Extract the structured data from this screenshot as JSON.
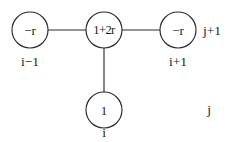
{
  "figure": {
    "kind": "finite-difference-stencil",
    "stroke_color": "#2b2b2b",
    "text_color": "#1c1c1c",
    "background_color": "#ffffff"
  },
  "nodes": [
    {
      "id": "left",
      "value": "−r",
      "cx": 30,
      "cy": 30,
      "r": 18
    },
    {
      "id": "center",
      "value": "1+2r",
      "cx": 104,
      "cy": 30,
      "r": 18
    },
    {
      "id": "right",
      "value": "−r",
      "cx": 178,
      "cy": 30,
      "r": 18
    },
    {
      "id": "bottom",
      "value": "1",
      "cx": 104,
      "cy": 110,
      "r": 18
    }
  ],
  "edges": [
    {
      "id": "left-center",
      "x1": 48,
      "y1": 30,
      "x2": 86,
      "y2": 30
    },
    {
      "id": "center-right",
      "x1": 122,
      "y1": 30,
      "x2": 160,
      "y2": 30
    },
    {
      "id": "center-bottom",
      "x1": 104,
      "y1": 48,
      "x2": 104,
      "y2": 92
    }
  ],
  "labels": {
    "space_left": {
      "text": "i−1",
      "x": 30,
      "y": 62
    },
    "space_right": {
      "text": "i+1",
      "x": 178,
      "y": 62
    },
    "space_bottom": {
      "text": "i",
      "x": 104,
      "y": 133
    },
    "time_upper": {
      "text": "j+1",
      "x": 212,
      "y": 31
    },
    "time_lower": {
      "text": "j",
      "x": 209,
      "y": 110
    }
  }
}
